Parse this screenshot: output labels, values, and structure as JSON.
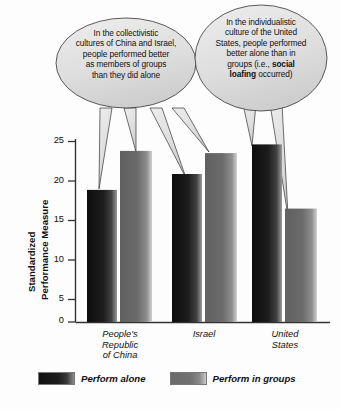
{
  "chart_data": {
    "type": "bar",
    "title": "",
    "xlabel": "",
    "ylabel": "Standardized Performance Measure",
    "ylabel_line1": "Standardized",
    "ylabel_line2": "Performance Measure",
    "categories": [
      "People's Republic of China",
      "Israel",
      "United States"
    ],
    "category_lines": [
      [
        "People's",
        "Republic",
        "of China"
      ],
      [
        "Israel"
      ],
      [
        "United",
        "States"
      ]
    ],
    "series": [
      {
        "name": "Perform alone",
        "values": [
          18.3,
          20.5,
          24.6
        ],
        "color": "#1a1a1a"
      },
      {
        "name": "Perform in groups",
        "values": [
          23.7,
          23.4,
          15.7
        ],
        "color": "#5f5f5f"
      }
    ],
    "ylim": [
      0,
      25
    ],
    "yticks": [
      0,
      5,
      10,
      15,
      20,
      25
    ],
    "ytick_labels": [
      "0",
      "5",
      "10",
      "15",
      "20",
      "25"
    ],
    "grid": false,
    "legend_position": "bottom"
  },
  "annotations": [
    {
      "id": "callout-collectivistic",
      "lines": [
        "In the collectivistic",
        "cultures of China and Israel,",
        "people performed better",
        "as members of groups",
        "than they did alone"
      ],
      "points_to": [
        "China alone",
        "China groups",
        "Israel alone",
        "Israel groups"
      ]
    },
    {
      "id": "callout-individualistic",
      "lines_rich": [
        [
          {
            "t": "In the individualistic",
            "b": false
          }
        ],
        [
          {
            "t": "culture of the United",
            "b": false
          }
        ],
        [
          {
            "t": "States, people performed",
            "b": false
          }
        ],
        [
          {
            "t": "better alone than in",
            "b": false
          }
        ],
        [
          {
            "t": "groups (i.e., ",
            "b": false
          },
          {
            "t": "social",
            "b": true
          }
        ],
        [
          {
            "t": "loafing",
            "b": true
          },
          {
            "t": " occurred)",
            "b": false
          }
        ]
      ],
      "points_to": [
        "United States alone",
        "United States groups"
      ]
    }
  ],
  "legend": {
    "items": [
      {
        "label": "Perform alone",
        "swatch": "dark"
      },
      {
        "label": "Perform in groups",
        "swatch": "gray"
      }
    ]
  },
  "colors": {
    "bar_alone": "#1a1a1a",
    "bar_groups": "#5f5f5f",
    "bubble_fill": "#e0e0e0",
    "axis": "#333333",
    "background": "#fdfdfd"
  }
}
